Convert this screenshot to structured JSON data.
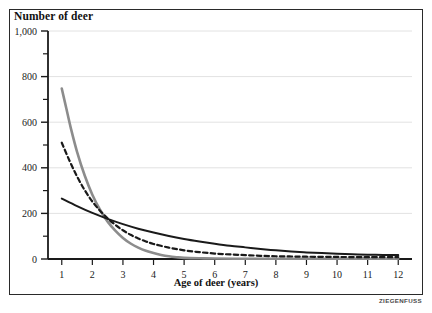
{
  "figure": {
    "credit": "ZIEGENFUSS"
  },
  "chart_data": {
    "type": "line",
    "title": "",
    "ylabel": "Number of deer",
    "xlabel": "Age of deer (years)",
    "xlim": [
      0.55,
      12.45
    ],
    "ylim": [
      0,
      1000
    ],
    "grid": true,
    "grid_axis": "y",
    "legend": "none",
    "x_ticks": [
      1,
      2,
      3,
      4,
      5,
      6,
      7,
      8,
      9,
      10,
      11,
      12
    ],
    "x_tick_labels": [
      "1",
      "2",
      "3",
      "4",
      "5",
      "6",
      "7",
      "8",
      "9",
      "10",
      "11",
      "12"
    ],
    "y_ticks": [
      0,
      200,
      400,
      600,
      800,
      1000
    ],
    "y_tick_labels": [
      "0",
      "200",
      "400",
      "600",
      "800",
      "1,000"
    ],
    "y_minor_ticks": [
      100,
      300,
      500,
      700,
      900
    ],
    "series": [
      {
        "name": "gray-curve",
        "style": "solid",
        "color": "#8c8c8c",
        "width": 2.6,
        "x": [
          1.0,
          1.15,
          1.3,
          1.5,
          1.75,
          2.0,
          2.25,
          2.5,
          2.75,
          3.0,
          3.25,
          3.5,
          3.75,
          4.0,
          4.25,
          4.5,
          4.75,
          5.0,
          5.5,
          6.0,
          7.0,
          8.0,
          9.0,
          10.0,
          11.0,
          12.0
        ],
        "values": [
          748,
          660,
          572,
          470,
          366,
          282,
          216,
          164,
          124,
          92,
          68,
          50,
          36,
          26,
          18,
          12,
          8,
          5,
          3,
          2,
          1,
          1,
          1,
          1,
          1,
          1
        ]
      },
      {
        "name": "dashed-curve",
        "style": "dashed",
        "color": "#1a1a1a",
        "width": 2.2,
        "x": [
          1.0,
          1.25,
          1.5,
          1.75,
          2.0,
          2.25,
          2.5,
          2.75,
          3.0,
          3.25,
          3.5,
          3.75,
          4.0,
          4.5,
          5.0,
          5.5,
          6.0,
          6.5,
          7.0,
          7.5,
          8.0,
          8.5,
          9.0,
          10.0,
          11.0,
          12.0
        ],
        "values": [
          510,
          432,
          362,
          302,
          252,
          212,
          178,
          150,
          126,
          106,
          90,
          77,
          66,
          50,
          38,
          30,
          24,
          20,
          17,
          14,
          12,
          11,
          10,
          9,
          8,
          8
        ]
      },
      {
        "name": "black-curve",
        "style": "solid",
        "color": "#1a1a1a",
        "width": 2.0,
        "x": [
          1.0,
          1.5,
          2.0,
          2.5,
          3.0,
          3.5,
          4.0,
          4.5,
          5.0,
          5.5,
          6.0,
          6.5,
          7.0,
          7.5,
          8.0,
          8.5,
          9.0,
          9.5,
          10.0,
          10.5,
          11.0,
          11.5,
          12.0
        ],
        "values": [
          265,
          232,
          202,
          176,
          153,
          133,
          116,
          101,
          88,
          77,
          67,
          58,
          51,
          44,
          38,
          33,
          29,
          26,
          23,
          21,
          19,
          18,
          17
        ]
      }
    ]
  }
}
